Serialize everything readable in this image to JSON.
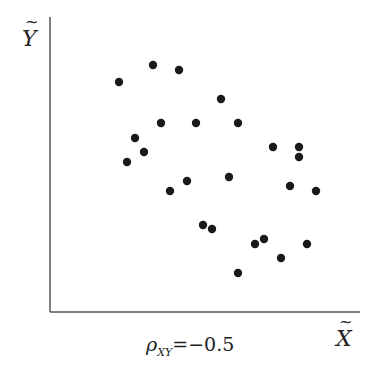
{
  "chart_data": {
    "type": "scatter",
    "title": "",
    "xlabel": "X̃",
    "ylabel": "Ỹ",
    "annotation": "ρ_XY = −0.5",
    "grid": false,
    "axis_pixel_frame": {
      "origin": [
        50,
        312
      ],
      "x_end": 360,
      "y_top": 17
    },
    "points": [
      {
        "x": 69,
        "y": 230
      },
      {
        "x": 103,
        "y": 247
      },
      {
        "x": 129,
        "y": 242
      },
      {
        "x": 171,
        "y": 213
      },
      {
        "x": 111,
        "y": 189
      },
      {
        "x": 146,
        "y": 189
      },
      {
        "x": 188,
        "y": 189
      },
      {
        "x": 85,
        "y": 174
      },
      {
        "x": 94,
        "y": 160
      },
      {
        "x": 77,
        "y": 150
      },
      {
        "x": 120,
        "y": 121
      },
      {
        "x": 137,
        "y": 131
      },
      {
        "x": 179,
        "y": 135
      },
      {
        "x": 223,
        "y": 165
      },
      {
        "x": 249,
        "y": 165
      },
      {
        "x": 249,
        "y": 155
      },
      {
        "x": 240,
        "y": 126
      },
      {
        "x": 266,
        "y": 121
      },
      {
        "x": 153,
        "y": 87
      },
      {
        "x": 162,
        "y": 83
      },
      {
        "x": 205,
        "y": 68
      },
      {
        "x": 214,
        "y": 73
      },
      {
        "x": 257,
        "y": 68
      },
      {
        "x": 231,
        "y": 54
      },
      {
        "x": 188,
        "y": 39
      }
    ],
    "point_color": "#1a1a1a",
    "axis_color": "#555555"
  },
  "labels": {
    "y_axis": "Y",
    "x_axis": "X",
    "tilde": "~",
    "rho_symbol": "ρ",
    "rho_sub": "XY",
    "rho_value": "=−0.5"
  }
}
